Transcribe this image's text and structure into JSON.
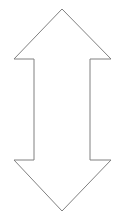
{
  "canvas": {
    "width": 126,
    "height": 219,
    "background_color": "#ffffff"
  },
  "figure": {
    "name": "double-headed-vertical-arrow",
    "label": "",
    "stroke_color": "#808080",
    "fill_color": "#ffffff",
    "stroke_width": 1,
    "geometry": {
      "top_apex": [
        62,
        9
      ],
      "bottom_apex": [
        62,
        211
      ],
      "upper_barb_y": 59,
      "lower_barb_y": 160,
      "left_barb_tip_x": 14,
      "right_barb_tip_x": 111,
      "shaft_left_x": 34,
      "shaft_right_x": 90,
      "points": "62,9 111,59 90,59 90,160 111,160 62,211 14,160 34,160 34,59 14,59"
    }
  }
}
